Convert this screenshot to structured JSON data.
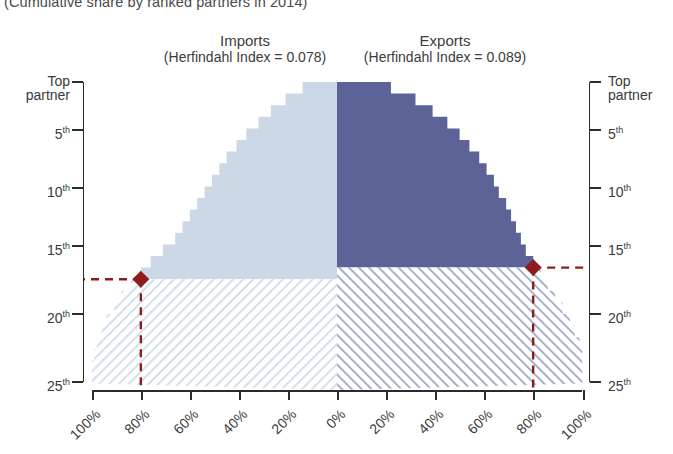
{
  "subtitle": "(Cumulative share by ranked partners in 2014)",
  "panels": {
    "imports": {
      "title": "Imports",
      "index_label": "(Herfindahl Index = 0.078)"
    },
    "exports": {
      "title": "Exports",
      "index_label": "(Herfindahl Index = 0.089)"
    }
  },
  "axes": {
    "y_left_title_line1": "Top",
    "y_left_title_line2": "partner",
    "y_right_title_line1": "Top",
    "y_right_title_line2": "partner",
    "y_ticks": [
      "5",
      "10",
      "15",
      "20",
      "25"
    ],
    "y_suffix": "th",
    "x_left_ticks": [
      "100%",
      "80%",
      "60%",
      "40%",
      "20%",
      "0%"
    ],
    "x_right_ticks": [
      "20%",
      "40%",
      "60%",
      "80%",
      "100%"
    ]
  },
  "colors": {
    "imports_solid": "#ccd8e6",
    "imports_hatch": "#d7e2ee",
    "exports_solid": "#5d6297",
    "exports_hatch": "#8f97bd",
    "marker": "#8e1c1c",
    "axis": "#2b2b2b",
    "text": "#3a3a3a"
  },
  "chart_data": {
    "type": "area",
    "title": "",
    "subtitle": "(Cumulative share by ranked partners in 2014)",
    "xlabel": "",
    "ylabel": "Partner rank",
    "orientation": "horizontal-back-to-back",
    "xlim": [
      -100,
      100
    ],
    "ylim": [
      1,
      26
    ],
    "grid": false,
    "legend": "none",
    "annotations": [
      {
        "label": "Imports marker",
        "rank": 17,
        "share": 80,
        "side": "imports"
      },
      {
        "label": "Exports marker",
        "rank": 16,
        "share": 80,
        "side": "exports"
      }
    ],
    "categories": [
      1,
      2,
      3,
      4,
      5,
      6,
      7,
      8,
      9,
      10,
      11,
      12,
      13,
      14,
      15,
      16,
      17,
      18,
      19,
      20,
      21,
      22,
      23,
      24,
      25,
      26
    ],
    "series": [
      {
        "name": "Imports (Herfindahl Index = 0.078)",
        "side": "left",
        "color": "#ccd8e6",
        "hatch_below_rank": 17,
        "values": [
          14,
          21,
          27,
          32,
          37,
          41,
          45,
          48,
          51,
          54,
          57,
          60,
          63,
          66,
          71,
          76,
          80,
          84,
          88,
          91,
          94,
          96,
          98,
          99,
          100,
          100
        ]
      },
      {
        "name": "Exports (Herfindahl Index = 0.089)",
        "side": "right",
        "color": "#5d6297",
        "hatch_below_rank": 16,
        "values": [
          22,
          32,
          39,
          45,
          50,
          54,
          58,
          61,
          64,
          66,
          69,
          71,
          73,
          75,
          77,
          80,
          83,
          86,
          89,
          92,
          95,
          97,
          99,
          100,
          100,
          100
        ]
      }
    ]
  }
}
